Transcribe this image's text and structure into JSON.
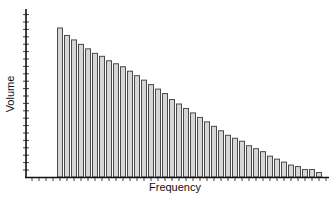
{
  "chart_data": {
    "type": "bar",
    "title": "",
    "xlabel": "Frequency",
    "ylabel": "Volume",
    "grid": false,
    "legend": null,
    "ylim": [
      0,
      100
    ],
    "categories": [
      "1",
      "2",
      "3",
      "4",
      "5",
      "6",
      "7",
      "8",
      "9",
      "10",
      "11",
      "12",
      "13",
      "14",
      "15",
      "16",
      "17",
      "18",
      "19",
      "20",
      "21",
      "22",
      "23",
      "24",
      "25",
      "26",
      "27",
      "28",
      "29",
      "30",
      "31",
      "32",
      "33",
      "34",
      "35",
      "36",
      "37",
      "38"
    ],
    "values": [
      100,
      95,
      92,
      89,
      86,
      83,
      81,
      78,
      76,
      74,
      71,
      68,
      65,
      62,
      59,
      56,
      52,
      49,
      46,
      43,
      40,
      37,
      34,
      31,
      28,
      26,
      24,
      21,
      19,
      17,
      14,
      12,
      10,
      8,
      7,
      5,
      5,
      3
    ],
    "colors": {
      "bar_fill": "#d6d6d6",
      "bar_stroke": "#4a4a4a",
      "axis": "#111111"
    },
    "x_ticks_count": 43,
    "y_ticks_count": 22
  }
}
